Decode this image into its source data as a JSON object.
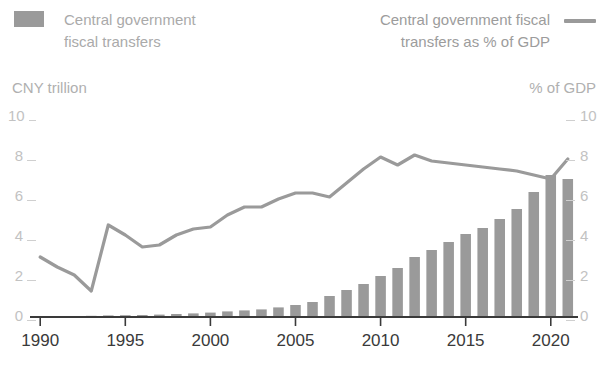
{
  "legend": {
    "bar_series_label": "Central government\nfiscal transfers",
    "bar_swatch_color": "#9a9a9a",
    "line_series_label": "Central government fiscal\ntransfers as % of GDP",
    "line_swatch_color": "#9a9a9a"
  },
  "axes": {
    "left_title": "CNY trillion",
    "right_title": "% of GDP",
    "left_ticks": [
      "10",
      "8",
      "6",
      "4",
      "2",
      "0"
    ],
    "right_ticks": [
      "10",
      "8",
      "6",
      "4",
      "2",
      "0"
    ],
    "x_ticks": [
      "1990",
      "1995",
      "2000",
      "2005",
      "2010",
      "2015",
      "2020"
    ]
  },
  "chart_data": {
    "type": "bar",
    "title": "",
    "xlabel": "",
    "ylabel": "CNY trillion",
    "y2label": "% of GDP",
    "ylim": [
      0,
      10
    ],
    "y2lim": [
      0,
      10
    ],
    "xlim": [
      1989.4,
      2021.6
    ],
    "grid": false,
    "legend_position": "top",
    "x": [
      1990,
      1991,
      1992,
      1993,
      1994,
      1995,
      1996,
      1997,
      1998,
      1999,
      2000,
      2001,
      2002,
      2003,
      2004,
      2005,
      2006,
      2007,
      2008,
      2009,
      2010,
      2011,
      2012,
      2013,
      2014,
      2015,
      2016,
      2017,
      2018,
      2019,
      2020,
      2021
    ],
    "series": [
      {
        "name": "Central government fiscal transfers",
        "type": "bar",
        "unit": "CNY trillion",
        "axis": "left",
        "color": "#9a9a9a",
        "values": [
          0.05,
          0.05,
          0.05,
          0.06,
          0.08,
          0.09,
          0.1,
          0.12,
          0.15,
          0.18,
          0.22,
          0.28,
          0.33,
          0.38,
          0.48,
          0.6,
          0.75,
          1.05,
          1.35,
          1.65,
          2.05,
          2.45,
          3.0,
          3.35,
          3.75,
          4.15,
          4.45,
          4.9,
          5.4,
          6.25,
          7.1,
          6.9
        ]
      },
      {
        "name": "Central government fiscal transfers as % of GDP",
        "type": "line",
        "unit": "% of GDP",
        "axis": "right",
        "color": "#9a9a9a",
        "values": [
          3.0,
          2.5,
          2.1,
          1.3,
          4.6,
          4.1,
          3.5,
          3.6,
          4.1,
          4.4,
          4.5,
          5.1,
          5.5,
          5.5,
          5.9,
          6.2,
          6.2,
          6.0,
          6.7,
          7.4,
          8.0,
          7.6,
          8.1,
          7.8,
          7.7,
          7.6,
          7.5,
          7.4,
          7.3,
          7.1,
          6.9,
          7.9
        ]
      }
    ]
  }
}
